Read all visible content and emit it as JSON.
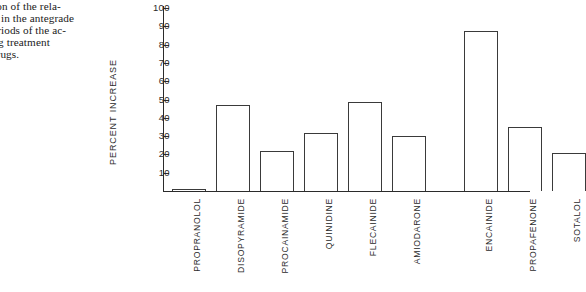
{
  "caption": {
    "text": "parison of the rela-\neases in the antegrade\nry periods of the ac-\nduring treatment\nnic drugs."
  },
  "chart_data": {
    "type": "bar",
    "title": "",
    "xlabel": "",
    "ylabel": "PERCENT INCREASE",
    "ylim": [
      0,
      100
    ],
    "ytick_step": 10,
    "ytick_labels": [
      "10",
      "20",
      "30",
      "40",
      "50",
      "60",
      "70",
      "80",
      "90",
      "100"
    ],
    "ytick_values": [
      10,
      20,
      30,
      40,
      50,
      60,
      70,
      80,
      90,
      100
    ],
    "grid": false,
    "legend": false,
    "categories": [
      "PROPRANOLOL",
      "DISOPYRAMIDE",
      "PROCAINAMIDE",
      "QUINIDINE",
      "FLECAINIDE",
      "AMIODARONE",
      "ENCAINIDE",
      "PROPAFENONE",
      "SOTALOL"
    ],
    "values": [
      1,
      47,
      22,
      31.5,
      48.5,
      30,
      87.5,
      35,
      21
    ],
    "bar_fill": "#ffffff",
    "bar_edge": "#3a3a3a",
    "axis_color": "#2b2b2b"
  }
}
